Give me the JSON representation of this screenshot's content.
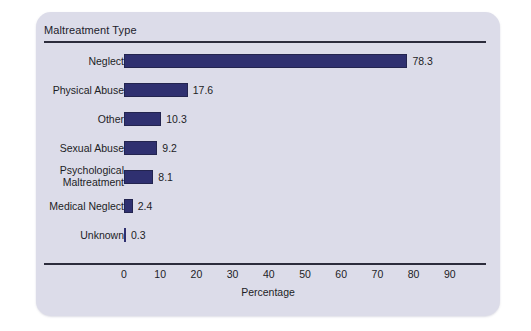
{
  "chart_data": {
    "type": "bar",
    "orientation": "horizontal",
    "title": "",
    "legend_title": "Maltreatment Type",
    "legend_position": "top-left",
    "grid": false,
    "categories": [
      "Neglect",
      "Physical Abuse",
      "Other",
      "Sexual Abuse",
      "Psychological\nMaltreatment",
      "Medical Neglect",
      "Unknown"
    ],
    "values": [
      78.3,
      17.6,
      10.3,
      9.2,
      8.1,
      2.4,
      0.3
    ],
    "value_labels": [
      "78.3",
      "17.6",
      "10.3",
      "9.2",
      "8.1",
      "2.4",
      "0.3"
    ],
    "xlabel": "Percentage",
    "ylabel": "Maltreatment Type",
    "xlim": [
      0,
      95
    ],
    "xticks": [
      0,
      10,
      20,
      30,
      40,
      50,
      60,
      70,
      80,
      90
    ],
    "xtick_labels": [
      "0",
      "10",
      "20",
      "30",
      "40",
      "50",
      "60",
      "70",
      "80",
      "90"
    ],
    "series_color": "#2F3070",
    "plot_background": "#DCDCE9",
    "axis_color": "#2C2C3C",
    "text_color": "#1D1D26"
  }
}
